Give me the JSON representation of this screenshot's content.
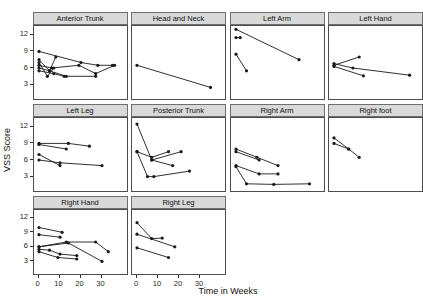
{
  "chart_data": {
    "type": "line",
    "title": "",
    "xlabel": "Time in Weeks",
    "ylabel": "VSS Score",
    "x_ticks": [
      0,
      10,
      20,
      30
    ],
    "y_ticks": [
      12,
      9,
      6,
      3
    ],
    "xlim": [
      -2,
      39
    ],
    "ylim": [
      0.4,
      13.6
    ],
    "grid": "off",
    "legend": "none",
    "facet_columns": 4,
    "facets": [
      {
        "label": "Anterior Trunk",
        "lines": [
          [
            [
              0,
              9
            ],
            [
              20,
              7
            ],
            [
              28,
              6.5
            ],
            [
              35,
              6.5
            ]
          ],
          [
            [
              0,
              7.5
            ],
            [
              5,
              5.5
            ],
            [
              8,
              8
            ]
          ],
          [
            [
              0,
              7
            ],
            [
              4,
              4.5
            ],
            [
              7,
              6
            ]
          ],
          [
            [
              0,
              6.5
            ],
            [
              6,
              6
            ],
            [
              19,
              6.5
            ],
            [
              27,
              5
            ],
            [
              36,
              6.5
            ]
          ],
          [
            [
              0,
              6
            ],
            [
              5,
              5.5
            ],
            [
              13,
              4.5
            ],
            [
              27,
              4.5
            ]
          ],
          [
            [
              0,
              5.5
            ],
            [
              7,
              5
            ],
            [
              12,
              4.5
            ]
          ]
        ]
      },
      {
        "label": "Head and Neck",
        "lines": [
          [
            [
              0,
              6.5
            ],
            [
              35,
              2.5
            ]
          ]
        ]
      },
      {
        "label": "Left Arm",
        "lines": [
          [
            [
              0,
              13
            ],
            [
              30,
              7.5
            ]
          ],
          [
            [
              0,
              11.5
            ],
            [
              2,
              11.5
            ]
          ],
          [
            [
              0,
              8.5
            ],
            [
              5,
              5.5
            ]
          ]
        ]
      },
      {
        "label": "Left Hand",
        "lines": [
          [
            [
              0,
              6.5
            ],
            [
              12,
              8
            ]
          ],
          [
            [
              0,
              6.8
            ],
            [
              9,
              6
            ],
            [
              36,
              4.7
            ]
          ],
          [
            [
              0,
              6.3
            ],
            [
              14,
              4.6
            ]
          ]
        ]
      },
      {
        "label": "Left Leg",
        "lines": [
          [
            [
              0,
              9
            ],
            [
              14,
              9
            ],
            [
              24,
              8.5
            ]
          ],
          [
            [
              0,
              8.8
            ],
            [
              13,
              8
            ]
          ],
          [
            [
              0,
              7
            ],
            [
              10,
              5
            ]
          ],
          [
            [
              0,
              6
            ],
            [
              10,
              5.5
            ],
            [
              30,
              5
            ]
          ]
        ]
      },
      {
        "label": "Posterior Trunk",
        "lines": [
          [
            [
              0,
              12.5
            ],
            [
              7,
              6
            ],
            [
              21,
              7.5
            ]
          ],
          [
            [
              0,
              7.5
            ],
            [
              7,
              6.5
            ],
            [
              15,
              7.5
            ]
          ],
          [
            [
              0,
              7.5
            ],
            [
              5,
              3
            ],
            [
              8,
              3
            ],
            [
              25,
              4
            ]
          ],
          [
            [
              7,
              6
            ],
            [
              17,
              5
            ]
          ]
        ]
      },
      {
        "label": "Right Arm",
        "lines": [
          [
            [
              0,
              8
            ],
            [
              10,
              6.5
            ],
            [
              20,
              5
            ]
          ],
          [
            [
              0,
              7.5
            ],
            [
              11,
              6
            ]
          ],
          [
            [
              0,
              5
            ],
            [
              11,
              3.5
            ],
            [
              20,
              3.5
            ]
          ],
          [
            [
              0,
              4.8
            ],
            [
              5,
              1.7
            ],
            [
              18,
              1.6
            ],
            [
              35,
              1.7
            ]
          ]
        ]
      },
      {
        "label": "Right foot",
        "lines": [
          [
            [
              0,
              10
            ],
            [
              7,
              8
            ],
            [
              12,
              6.5
            ]
          ],
          [
            [
              0,
              9
            ],
            [
              7,
              8
            ]
          ]
        ]
      },
      {
        "label": "Right Hand",
        "lines": [
          [
            [
              0,
              10
            ],
            [
              11,
              9
            ]
          ],
          [
            [
              0,
              8.5
            ],
            [
              10,
              8
            ]
          ],
          [
            [
              0,
              6
            ],
            [
              13,
              7
            ],
            [
              27,
              7
            ],
            [
              33,
              5
            ]
          ],
          [
            [
              0,
              6
            ],
            [
              14,
              6.8
            ],
            [
              30,
              3
            ]
          ],
          [
            [
              0,
              5.5
            ],
            [
              5,
              5.3
            ],
            [
              10,
              4.5
            ],
            [
              18,
              4.2
            ]
          ],
          [
            [
              0,
              5
            ],
            [
              9,
              3.8
            ],
            [
              18,
              3.5
            ]
          ]
        ]
      },
      {
        "label": "Right Leg",
        "lines": [
          [
            [
              0,
              11
            ],
            [
              7,
              7.7
            ],
            [
              12,
              7.8
            ]
          ],
          [
            [
              0,
              8.6
            ],
            [
              18,
              6
            ]
          ],
          [
            [
              0,
              5.8
            ],
            [
              15,
              3.8
            ]
          ]
        ]
      }
    ],
    "colors": {
      "line": "#1a1a1a",
      "point": "#1a1a1a",
      "strip_background": "#d9d9d9",
      "strip_border": "#6e6e6e",
      "panel_border": "#4d4d4d",
      "panel_background": "#ffffff",
      "text": "#262626"
    }
  }
}
